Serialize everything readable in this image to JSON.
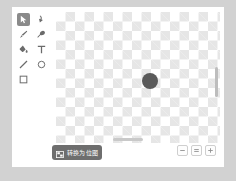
{
  "theme": {
    "page_background": "#d2d2d2",
    "panel_background": "#ffffff",
    "selected_tool_highlight": "#8a8a8a",
    "icon_color": "#6b6b6b",
    "primary_button_background": "#6e6e6e",
    "primary_button_text": "#ffffff",
    "canvas_checker_light": "#ffffff",
    "canvas_checker_dark": "#e6e6e6",
    "shape_fill": "#5a5a5a"
  },
  "toolbar": {
    "name": "drawing-tools",
    "selected_tool": "select",
    "tools": [
      {
        "id": "select",
        "icon": "cursor-arrow-icon",
        "label": "选择",
        "selected": true
      },
      {
        "id": "reshape",
        "icon": "reshape-node-icon",
        "label": "变形",
        "selected": false
      },
      {
        "id": "brush",
        "icon": "brush-icon",
        "label": "画笔",
        "selected": false
      },
      {
        "id": "eraser",
        "icon": "eraser-icon",
        "label": "橡皮擦",
        "selected": false
      },
      {
        "id": "fill",
        "icon": "paint-bucket-icon",
        "label": "填充",
        "selected": false
      },
      {
        "id": "text",
        "icon": "text-icon",
        "label": "文本",
        "selected": false
      },
      {
        "id": "line",
        "icon": "line-icon",
        "label": "线条",
        "selected": false
      },
      {
        "id": "ellipse",
        "icon": "circle-icon",
        "label": "圆",
        "selected": false
      },
      {
        "id": "rectangle",
        "icon": "square-icon",
        "label": "矩形",
        "selected": false
      }
    ]
  },
  "canvas": {
    "name": "drawing-canvas",
    "background": "transparent-checkerboard",
    "vertical_scrollbar": {
      "visible": true
    },
    "horizontal_scrollbar": {
      "visible": true
    },
    "shapes": [
      {
        "id": "circle-1",
        "type": "circle",
        "fill": "#5a5a5a",
        "x": 86,
        "y": 61,
        "diameter": 16
      }
    ]
  },
  "bottom_bar": {
    "convert_button": {
      "label": "转换为位图",
      "icon": "bitmap-icon"
    },
    "zoom_controls": [
      {
        "id": "zoom-out",
        "icon": "minus-icon",
        "label": "−"
      },
      {
        "id": "zoom-reset",
        "icon": "equals-icon",
        "label": "="
      },
      {
        "id": "zoom-in",
        "icon": "plus-icon",
        "label": "+"
      }
    ]
  }
}
